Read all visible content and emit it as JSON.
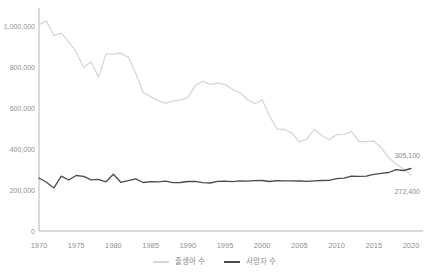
{
  "chart_data": {
    "type": "line",
    "title": "",
    "xlabel": "",
    "ylabel": "",
    "xlim": [
      1970,
      2020
    ],
    "ylim": [
      0,
      1000000
    ],
    "grid": false,
    "legend_position": "bottom-center",
    "x": [
      1970,
      1971,
      1972,
      1973,
      1974,
      1975,
      1976,
      1977,
      1978,
      1979,
      1980,
      1981,
      1982,
      1983,
      1984,
      1985,
      1986,
      1987,
      1988,
      1989,
      1990,
      1991,
      1992,
      1993,
      1994,
      1995,
      1996,
      1997,
      1998,
      1999,
      2000,
      2001,
      2002,
      2003,
      2004,
      2005,
      2006,
      2007,
      2008,
      2009,
      2010,
      2011,
      2012,
      2013,
      2014,
      2015,
      2016,
      2017,
      2018,
      2019,
      2020
    ],
    "series": [
      {
        "name": "출생아 수",
        "color": "#d7d7d7",
        "values": [
          1006600,
          1024800,
          952800,
          965500,
          922800,
          874000,
          796300,
          825300,
          750700,
          862700,
          862800,
          867400,
          848300,
          769200,
          674800,
          655500,
          636000,
          623800,
          633100,
          639400,
          649700,
          709300,
          730700,
          715800,
          721200,
          715000,
          691200,
          675400,
          641600,
          620700,
          640100,
          559900,
          496900,
          495000,
          477000,
          435000,
          448800,
          496800,
          465900,
          444800,
          470200,
          471300,
          484600,
          436500,
          435400,
          438400,
          406200,
          357800,
          326800,
          302700,
          272400
        ]
      },
      {
        "name": "사망자 수",
        "color": "#4a4a4a",
        "values": [
          258600,
          237500,
          210100,
          267500,
          248800,
          270700,
          266900,
          249300,
          252300,
          240000,
          277300,
          237500,
          245800,
          254600,
          236400,
          240400,
          239300,
          243500,
          235800,
          236800,
          241600,
          242300,
          236200,
          234300,
          242400,
          242800,
          241100,
          244700,
          243200,
          245400,
          246200,
          241500,
          245300,
          244500,
          244200,
          243900,
          242300,
          244900,
          246100,
          246900,
          255400,
          257400,
          267200,
          266300,
          267700,
          275900,
          280800,
          285500,
          298800,
          295100,
          305100
        ]
      }
    ],
    "yticks": [
      {
        "value": 0,
        "label": "0"
      },
      {
        "value": 200000,
        "label": "200,000"
      },
      {
        "value": 400000,
        "label": "400,000"
      },
      {
        "value": 600000,
        "label": "600,000"
      },
      {
        "value": 800000,
        "label": "800,000"
      },
      {
        "value": 1000000,
        "label": "1,000,000"
      }
    ],
    "xticks": [
      {
        "value": 1970,
        "label": "1970"
      },
      {
        "value": 1975,
        "label": "1975"
      },
      {
        "value": 1980,
        "label": "1980"
      },
      {
        "value": 1985,
        "label": "1985"
      },
      {
        "value": 1990,
        "label": "1990"
      },
      {
        "value": 1995,
        "label": "1995"
      },
      {
        "value": 2000,
        "label": "2000"
      },
      {
        "value": 2005,
        "label": "2005"
      },
      {
        "value": 2010,
        "label": "2010"
      },
      {
        "value": 2015,
        "label": "2015"
      },
      {
        "value": 2020,
        "label": "2020"
      }
    ],
    "annotations": [
      {
        "text": "305,100",
        "series": "사망자 수",
        "year": 2020,
        "value": 305100,
        "placement": "above-end"
      },
      {
        "text": "272,400",
        "series": "출생아 수",
        "year": 2020,
        "value": 272400,
        "placement": "below-end"
      }
    ]
  },
  "colors": {
    "background": "#ffffff",
    "axis": "#b5b5b5",
    "tick_text": "#8f8f8f",
    "annotation_text": "#8a8a8a",
    "births_line": "#d7d7d7",
    "deaths_line": "#4a4a4a"
  }
}
